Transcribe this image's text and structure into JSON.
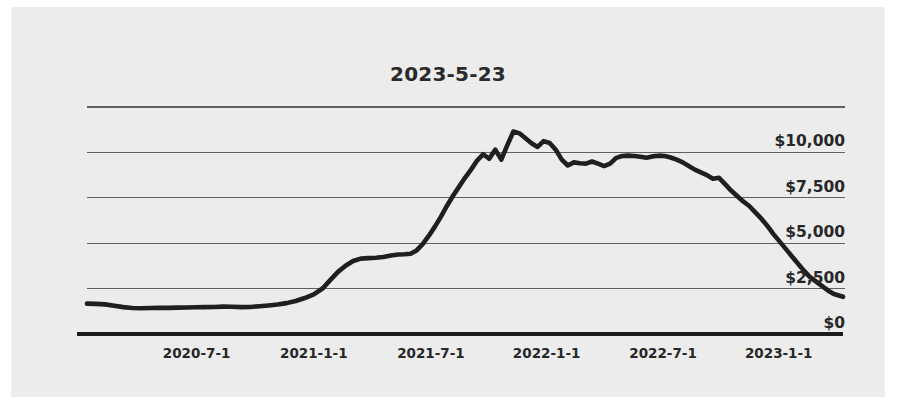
{
  "chart_data": {
    "type": "line",
    "title": "2023-5-23",
    "xlabel": "",
    "ylabel": "",
    "grid": true,
    "legend": false,
    "y_tick_labels": [
      "$10,000",
      "$7,500",
      "$5,000",
      "$2,500",
      "$0"
    ],
    "y_tick_values": [
      10000,
      7500,
      5000,
      2500,
      0
    ],
    "ylim": [
      0,
      12500
    ],
    "x_tick_labels": [
      "2020-7-1",
      "2021-1-1",
      "2021-7-1",
      "2022-1-1",
      "2022-7-1",
      "2023-1-1"
    ],
    "x_tick_positions": [
      0.145,
      0.3,
      0.455,
      0.608,
      0.762,
      0.915
    ],
    "line_color": "#1f1f1f",
    "grid_color": "#606060",
    "axis_color": "#1c1c1c",
    "background_color": "#ececec",
    "series": [
      {
        "name": "value",
        "x": [
          0.0,
          0.012,
          0.024,
          0.036,
          0.048,
          0.06,
          0.072,
          0.084,
          0.096,
          0.108,
          0.12,
          0.132,
          0.144,
          0.156,
          0.168,
          0.18,
          0.192,
          0.204,
          0.216,
          0.228,
          0.24,
          0.252,
          0.264,
          0.276,
          0.288,
          0.3,
          0.312,
          0.322,
          0.332,
          0.342,
          0.352,
          0.362,
          0.372,
          0.382,
          0.392,
          0.402,
          0.412,
          0.42,
          0.428,
          0.436,
          0.444,
          0.452,
          0.46,
          0.468,
          0.476,
          0.484,
          0.492,
          0.5,
          0.508,
          0.516,
          0.524,
          0.532,
          0.54,
          0.548,
          0.556,
          0.564,
          0.572,
          0.58,
          0.588,
          0.596,
          0.604,
          0.612,
          0.62,
          0.628,
          0.636,
          0.644,
          0.652,
          0.66,
          0.668,
          0.676,
          0.684,
          0.692,
          0.7,
          0.708,
          0.716,
          0.724,
          0.732,
          0.74,
          0.748,
          0.756,
          0.764,
          0.772,
          0.78,
          0.788,
          0.796,
          0.804,
          0.812,
          0.82,
          0.828,
          0.836,
          0.844,
          0.852,
          0.86,
          0.868,
          0.876,
          0.884,
          0.892,
          0.9,
          0.908,
          0.916,
          0.924,
          0.932,
          0.94,
          0.948,
          0.956,
          0.964,
          0.972,
          0.98,
          0.988,
          1.0
        ],
        "values": [
          1670,
          1660,
          1630,
          1560,
          1480,
          1430,
          1420,
          1430,
          1440,
          1440,
          1450,
          1460,
          1470,
          1480,
          1490,
          1510,
          1500,
          1480,
          1490,
          1530,
          1570,
          1620,
          1700,
          1820,
          1980,
          2180,
          2520,
          2980,
          3420,
          3760,
          4020,
          4150,
          4180,
          4200,
          4240,
          4320,
          4380,
          4390,
          4420,
          4600,
          4950,
          5400,
          5900,
          6450,
          7050,
          7600,
          8100,
          8600,
          9050,
          9550,
          9900,
          9650,
          10150,
          9600,
          10400,
          11150,
          11050,
          10780,
          10500,
          10300,
          10620,
          10520,
          10150,
          9600,
          9280,
          9450,
          9400,
          9380,
          9500,
          9380,
          9250,
          9380,
          9700,
          9800,
          9820,
          9800,
          9760,
          9700,
          9780,
          9820,
          9800,
          9720,
          9600,
          9450,
          9250,
          9050,
          8900,
          8750,
          8550,
          8600,
          8250,
          7900,
          7600,
          7300,
          7050,
          6700,
          6350,
          5950,
          5500,
          5100,
          4700,
          4300,
          3900,
          3500,
          3150,
          2900,
          2650,
          2400,
          2200,
          2050
        ]
      }
    ]
  },
  "plot": {
    "left_px": 76,
    "right_px": 832,
    "top_px": 99,
    "zero_px": 327,
    "unit_px_per_2500": 45.4
  }
}
